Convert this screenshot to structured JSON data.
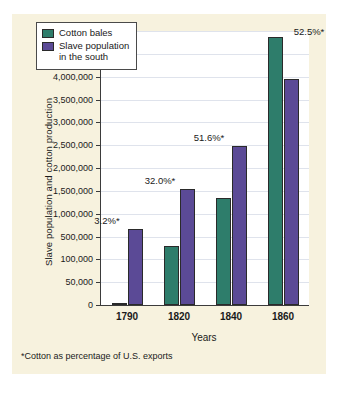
{
  "chart_data": {
    "type": "bar",
    "title": "",
    "xlabel": "Years",
    "ylabel": "Slave population and cotton production",
    "categories": [
      "1790",
      "1820",
      "1840",
      "1860"
    ],
    "series": [
      {
        "name": "Cotton bales",
        "color": "#2e7d6b",
        "values": [
          3000,
          335000,
          1350000,
          4861000
        ]
      },
      {
        "name": "Slave population in the south",
        "color": "#5b4a96",
        "values": [
          657000,
          1538000,
          2487000,
          3954000
        ]
      }
    ],
    "annotations": [
      {
        "category": "1790",
        "text": "3.2%*"
      },
      {
        "category": "1820",
        "text": "32.0%*"
      },
      {
        "category": "1840",
        "text": "51.6%*"
      },
      {
        "category": "1860",
        "text": "52.5%*"
      }
    ],
    "y_tick_labels": [
      "0",
      "50,000",
      "100,000",
      "500,000",
      "1,000,000",
      "1,500,000",
      "2,000,000",
      "2,500,000",
      "3,000,000",
      "3,500,000",
      "4,000,000",
      "4,500,000",
      "5,000,000"
    ],
    "y_tick_values": [
      0,
      50000,
      100000,
      500000,
      1000000,
      1500000,
      2000000,
      2500000,
      3000000,
      3500000,
      4000000,
      4500000,
      5000000
    ],
    "axis_scale": "piecewise-equal-spacing",
    "grid": true,
    "legend_position": "top-left-inside"
  },
  "legend": {
    "entries": [
      {
        "label": "Cotton bales",
        "color": "#2e7d6b"
      },
      {
        "label": "Slave population\nin the south",
        "color": "#5b4a96"
      }
    ]
  },
  "footnote": {
    "text": "*Cotton as percentage of U.S. exports"
  },
  "colors": {
    "panel_background": "#f7f2de",
    "plot_background": "#ffffff",
    "cotton_bales": "#2e7d6b",
    "slave_population": "#5b4a96",
    "axis": "#3b3b3b",
    "gridline": "#dfe3ec"
  }
}
